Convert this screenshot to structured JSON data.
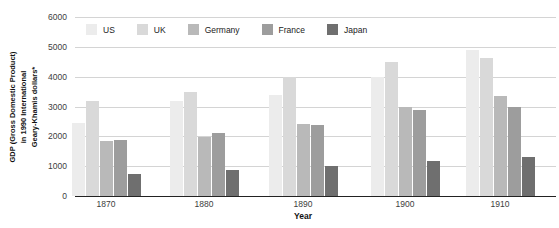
{
  "chart_data": {
    "type": "bar",
    "title": "",
    "xlabel": "Year",
    "ylabel_lines": [
      "GDP (Gross Domestic Product)",
      "in 1990 International",
      "Geary-Khamis dollars*"
    ],
    "categories": [
      "1870",
      "1880",
      "1890",
      "1900",
      "1910"
    ],
    "series": [
      {
        "name": "US",
        "color": "#ececec",
        "values": [
          2450,
          3180,
          3390,
          4000,
          4900
        ]
      },
      {
        "name": "UK",
        "color": "#d9d9d9",
        "values": [
          3190,
          3480,
          4000,
          4490,
          4610
        ]
      },
      {
        "name": "Germany",
        "color": "#b9b9b9",
        "values": [
          1840,
          1990,
          2430,
          2990,
          3350
        ]
      },
      {
        "name": "France",
        "color": "#9d9d9d",
        "values": [
          1880,
          2120,
          2380,
          2880,
          2970
        ]
      },
      {
        "name": "Japan",
        "color": "#6f6f6f",
        "values": [
          740,
          860,
          1010,
          1180,
          1300
        ]
      }
    ],
    "ylim": [
      0,
      6000
    ],
    "yticks": [
      0,
      1000,
      2000,
      3000,
      4000,
      5000,
      6000
    ],
    "grid": true,
    "legend_position": "top-left-inside"
  },
  "style": {
    "grid_color": "#d4d4d4",
    "axis_color": "#222222",
    "tick_text_color": "#3d3d3d",
    "background": "#ffffff"
  },
  "layout": {
    "group_centers_px": [
      31,
      129,
      228,
      330,
      425
    ]
  }
}
